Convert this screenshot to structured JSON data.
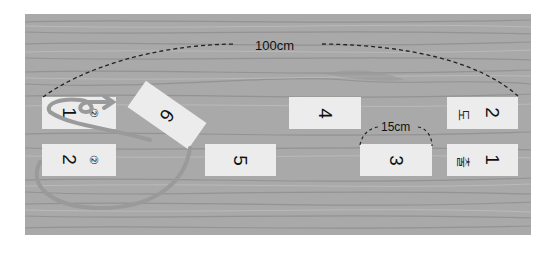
{
  "diagram": {
    "type": "hopscotch-court",
    "background": "wood-floor",
    "dimensions": {
      "total_length_label": "100cm",
      "arc_label": "15cm"
    },
    "boxes": [
      {
        "id": "b1-left",
        "number": "1",
        "marker": "②"
      },
      {
        "id": "b2-left",
        "number": "2",
        "marker": "②"
      },
      {
        "id": "b6",
        "number": "6"
      },
      {
        "id": "b5",
        "number": "5"
      },
      {
        "id": "b4",
        "number": "4"
      },
      {
        "id": "b3",
        "number": "3"
      },
      {
        "id": "b2-right",
        "number": "2",
        "korean": "도"
      },
      {
        "id": "b1-right",
        "number": "1",
        "korean": "출"
      }
    ],
    "colors": {
      "wood": "#a9a9a9",
      "box": "#ececec",
      "path": "#9a9a9a",
      "dashed": "#222222"
    }
  }
}
